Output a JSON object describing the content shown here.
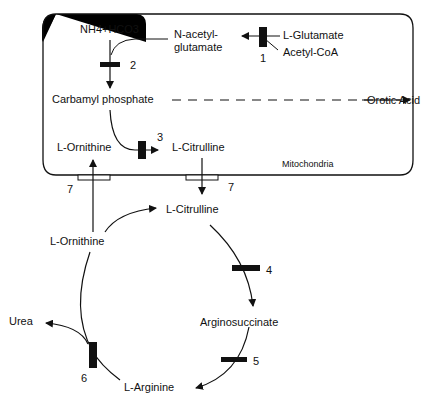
{
  "diagram": {
    "type": "metabolic-pathway",
    "compartment_label": "Mitochondria",
    "metabolites": {
      "nh4_hco3": "NH4+HCO3",
      "n_acetyl_glutamate_line1": "N-acetyl-",
      "n_acetyl_glutamate_line2": "glutamate",
      "l_glutamate": "L-Glutamate",
      "acetyl_coa": "Acetyl-CoA",
      "carbamyl_phosphate": "Carbamyl phosphate",
      "orotic_acid": "Orotic Acid",
      "l_ornithine_mito": "L-Ornithine",
      "l_citrulline_mito": "L-Citrulline",
      "l_citrulline_cyto": "L-Citrulline",
      "l_ornithine_cyto": "L-Ornithine",
      "arginosuccinate": "Arginosuccinate",
      "l_arginine": "L-Arginine",
      "urea": "Urea"
    },
    "enzymes": {
      "e1": "1",
      "e2": "2",
      "e3": "3",
      "e4": "4",
      "e5": "5",
      "e6": "6",
      "e7a": "7",
      "e7b": "7"
    },
    "edges": [
      {
        "from": "L-Glutamate + Acetyl-CoA",
        "to": "N-acetyl-glutamate",
        "enzyme": "1"
      },
      {
        "from": "NH4+HCO3",
        "to": "Carbamyl phosphate",
        "enzyme": "2",
        "activator": "N-acetyl-glutamate"
      },
      {
        "from": "Carbamyl phosphate",
        "to": "Orotic Acid",
        "style": "dashed"
      },
      {
        "from": "Carbamyl phosphate + L-Ornithine",
        "to": "L-Citrulline",
        "enzyme": "3"
      },
      {
        "from": "L-Citrulline (mito)",
        "to": "L-Citrulline (cyto)",
        "enzyme": "7"
      },
      {
        "from": "L-Citrulline",
        "to": "Arginosuccinate",
        "enzyme": "4"
      },
      {
        "from": "Arginosuccinate",
        "to": "L-Arginine",
        "enzyme": "5"
      },
      {
        "from": "L-Arginine",
        "to": "L-Ornithine + Urea",
        "enzyme": "6"
      },
      {
        "from": "L-Ornithine (cyto)",
        "to": "L-Ornithine (mito)",
        "enzyme": "7"
      }
    ]
  }
}
